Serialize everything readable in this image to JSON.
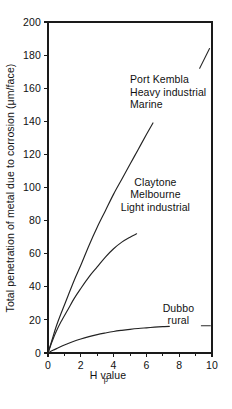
{
  "chart_data": {
    "type": "line",
    "title": "",
    "subtitle": "",
    "xlabel": "pH value",
    "xlabel_prefix": "p",
    "xlabel_rest": "H value",
    "ylabel": "Total penetration of metal due to corrosion (μm/face)",
    "xlim": [
      0,
      10
    ],
    "ylim": [
      0,
      200
    ],
    "xticks": [
      0,
      2,
      4,
      6,
      8,
      10
    ],
    "xtick_labels": [
      "0",
      "2",
      "4",
      "6",
      "8",
      "10"
    ],
    "x_minor_ticks": [
      1,
      3,
      5,
      7,
      9
    ],
    "yticks": [
      0,
      20,
      40,
      60,
      80,
      100,
      120,
      140,
      160,
      180,
      200
    ],
    "ytick_labels": [
      "0",
      "20",
      "40",
      "60",
      "80",
      "100",
      "120",
      "140",
      "160",
      "180",
      "200"
    ],
    "grid": false,
    "legend_position": "inline-annotations",
    "series": [
      {
        "name": "Port Kembla Heavy industrial Marine",
        "label_lines": [
          "Port Kembla",
          "Heavy industrial",
          "Marine"
        ],
        "color": "#232323",
        "x": [
          0,
          0.25,
          0.5,
          0.8,
          1.2,
          1.6,
          2.0,
          2.5,
          3.0,
          3.5,
          4.0,
          4.5,
          5.0,
          5.5,
          6.0,
          6.4
        ],
        "y": [
          0,
          8,
          16,
          24,
          34,
          44,
          53,
          65,
          76,
          86,
          96,
          105,
          114,
          123,
          132,
          139
        ]
      },
      {
        "name": "Claytone Melbourne Light industrial",
        "label_lines": [
          "Claytone",
          "Melbourne",
          "Light industrial"
        ],
        "color": "#232323",
        "x": [
          0,
          0.25,
          0.5,
          0.8,
          1.2,
          1.6,
          2.0,
          2.5,
          3.0,
          3.5,
          4.0,
          4.5,
          5.0,
          5.4
        ],
        "y": [
          0,
          7,
          13,
          19,
          26,
          33,
          39,
          46,
          52,
          58,
          63,
          67,
          70,
          72
        ]
      },
      {
        "name": "Dubbo rural",
        "label_lines": [
          "Dubbo",
          "rural"
        ],
        "color": "#232323",
        "x": [
          0,
          0.3,
          0.6,
          1.0,
          1.5,
          2.0,
          2.5,
          3.0,
          3.5,
          4.0,
          4.5,
          5.0,
          5.5,
          6.0,
          6.5,
          7.0,
          7.4
        ],
        "y": [
          0,
          1.6,
          3.0,
          4.8,
          6.8,
          8.5,
          9.9,
          11.1,
          12.1,
          13.0,
          13.7,
          14.3,
          14.8,
          15.2,
          15.6,
          15.9,
          16.1
        ]
      }
    ],
    "annotations": [
      {
        "name": "port-kembla-leader",
        "type": "leader-line",
        "x1": 9.25,
        "y1": 172,
        "x2": 9.85,
        "y2": 184
      },
      {
        "name": "dubbo-leader",
        "type": "leader-dash",
        "x1": 9.35,
        "y1": 16.5,
        "x2": 9.9,
        "y2": 16.5
      }
    ],
    "annotation_labels": {
      "port_kembla": {
        "x": 5.0,
        "y": 163,
        "lines": [
          "Port Kembla",
          "Heavy industrial",
          "Marine"
        ]
      },
      "claytone": {
        "x": 6.55,
        "y": 101,
        "lines": [
          "Claytone",
          "Melbourne",
          "Light industrial"
        ]
      },
      "dubbo": {
        "x": 7.95,
        "y": 25,
        "lines": [
          "Dubbo",
          "rural"
        ]
      }
    },
    "colors": {
      "axis": "#1a1a1a",
      "curve": "#232323",
      "text": "#111111",
      "background": "#ffffff"
    }
  }
}
